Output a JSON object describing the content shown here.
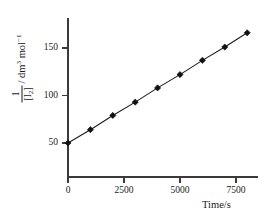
{
  "chart_data": {
    "type": "line",
    "title": "",
    "subtitle": "",
    "xlabel": "Time/s",
    "ylabel_numerator": "1",
    "ylabel_denominator": "[I2]",
    "ylabel_unit_prefix": "/ dm",
    "ylabel_unit_sup1": "3",
    "ylabel_unit_mid": " mol",
    "ylabel_unit_sup2": "−1",
    "x": [
      0,
      1000,
      2000,
      3000,
      4000,
      5000,
      6000,
      7000,
      8000
    ],
    "values": [
      50,
      64,
      79,
      93,
      108,
      122,
      137,
      151,
      166
    ],
    "series": [
      {
        "name": "1/[I2] vs time",
        "values": [
          50,
          64,
          79,
          93,
          108,
          122,
          137,
          151,
          166
        ]
      }
    ],
    "xticks": [
      0,
      2500,
      5000,
      7500
    ],
    "xtick_labels": [
      "0",
      "2500",
      "5000",
      "7500"
    ],
    "yticks": [
      50,
      100,
      150
    ],
    "ytick_labels": [
      "50",
      "100",
      "150"
    ],
    "xlim": [
      -400,
      8800
    ],
    "ylim": [
      -5,
      180
    ],
    "grid": false,
    "legend": false,
    "legend_position": "none",
    "marker": "diamond",
    "line_color": "#1c1c1c",
    "marker_color": "#111111",
    "axis_color": "#3a3a3a",
    "background_color": "#ffffff"
  }
}
